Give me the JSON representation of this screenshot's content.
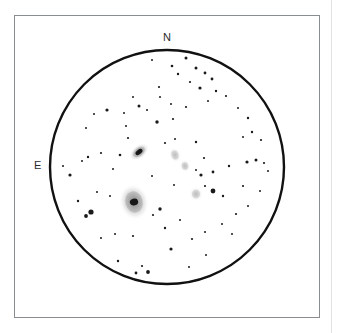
{
  "figure": {
    "kind": "telescope-eyepiece-sketch",
    "background_color": "#ffffff",
    "ink_color": "#1a1a1a",
    "frame": {
      "x": 14,
      "y": 15,
      "width": 306,
      "height": 303,
      "border_color": "#8a8d90"
    },
    "page_edge_rule": {
      "x": 331,
      "color": "#e2e3e5"
    }
  },
  "field_of_view": {
    "center_x": 167,
    "center_y": 167,
    "radius": 117,
    "outline_color": "#111111",
    "outline_width": 2.4
  },
  "orientation_labels": {
    "north": "N",
    "east": "E"
  },
  "chart_data": {
    "type": "scatter",
    "title": "",
    "xlabel": "",
    "ylabel": "",
    "grid": false,
    "legend": "none",
    "field_circle": {
      "cx": 167,
      "cy": 167,
      "r": 117
    },
    "xlim": [
      50,
      284
    ],
    "ylim": [
      50,
      284
    ],
    "galaxies": [
      {
        "name": "galaxy-elongated-upper",
        "cx": 139,
        "cy": 152,
        "rx": 11.5,
        "ry": 7.0,
        "angle": -38,
        "core_rx": 4.0,
        "core_ry": 2.3,
        "brightness": "bright"
      },
      {
        "name": "galaxy-large-lower",
        "cx": 134,
        "cy": 202,
        "rx": 15.0,
        "ry": 18.5,
        "angle": -15,
        "core_rx": 4.2,
        "core_ry": 3.4,
        "brightness": "bright"
      },
      {
        "name": "galaxy-faint-center-upper",
        "cx": 175,
        "cy": 155,
        "rx": 6.0,
        "ry": 8.0,
        "angle": -20,
        "core_rx": 0,
        "core_ry": 0,
        "brightness": "faint"
      },
      {
        "name": "galaxy-faint-center-lower",
        "cx": 185,
        "cy": 166,
        "rx": 5.5,
        "ry": 6.5,
        "angle": -10,
        "core_rx": 0,
        "core_ry": 0,
        "brightness": "faint"
      },
      {
        "name": "galaxy-faint-right",
        "cx": 196,
        "cy": 194,
        "rx": 7.0,
        "ry": 7.5,
        "angle": 0,
        "core_rx": 0,
        "core_ry": 0,
        "brightness": "faint"
      }
    ],
    "stars": [
      {
        "x": 186,
        "y": 58,
        "r": 1.5
      },
      {
        "x": 172,
        "y": 66,
        "r": 1.3
      },
      {
        "x": 196,
        "y": 68,
        "r": 1.5
      },
      {
        "x": 178,
        "y": 74,
        "r": 1.2
      },
      {
        "x": 205,
        "y": 73,
        "r": 1.4
      },
      {
        "x": 190,
        "y": 82,
        "r": 1.1
      },
      {
        "x": 212,
        "y": 79,
        "r": 1.4
      },
      {
        "x": 159,
        "y": 87,
        "r": 1.1
      },
      {
        "x": 200,
        "y": 88,
        "r": 1.6
      },
      {
        "x": 216,
        "y": 91,
        "r": 1.2
      },
      {
        "x": 139,
        "y": 106,
        "r": 1.5
      },
      {
        "x": 147,
        "y": 110,
        "r": 1.0
      },
      {
        "x": 124,
        "y": 113,
        "r": 1.0
      },
      {
        "x": 160,
        "y": 97,
        "r": 1.0
      },
      {
        "x": 133,
        "y": 97,
        "r": 1.0
      },
      {
        "x": 107,
        "y": 110,
        "r": 1.6
      },
      {
        "x": 94,
        "y": 114,
        "r": 1.0
      },
      {
        "x": 171,
        "y": 104,
        "r": 1.0
      },
      {
        "x": 157,
        "y": 122,
        "r": 1.7
      },
      {
        "x": 173,
        "y": 119,
        "r": 1.1
      },
      {
        "x": 186,
        "y": 107,
        "r": 1.1
      },
      {
        "x": 226,
        "y": 96,
        "r": 1.1
      },
      {
        "x": 238,
        "y": 108,
        "r": 1.0
      },
      {
        "x": 248,
        "y": 118,
        "r": 1.2
      },
      {
        "x": 252,
        "y": 132,
        "r": 1.2
      },
      {
        "x": 261,
        "y": 140,
        "r": 1.1
      },
      {
        "x": 86,
        "y": 128,
        "r": 1.0
      },
      {
        "x": 128,
        "y": 138,
        "r": 1.1
      },
      {
        "x": 120,
        "y": 155,
        "r": 1.3
      },
      {
        "x": 101,
        "y": 153,
        "r": 1.1
      },
      {
        "x": 88,
        "y": 157,
        "r": 1.2
      },
      {
        "x": 82,
        "y": 161,
        "r": 1.0
      },
      {
        "x": 70,
        "y": 175,
        "r": 1.6
      },
      {
        "x": 63,
        "y": 166,
        "r": 1.0
      },
      {
        "x": 175,
        "y": 139,
        "r": 1.0
      },
      {
        "x": 196,
        "y": 142,
        "r": 1.2
      },
      {
        "x": 165,
        "y": 143,
        "r": 1.1
      },
      {
        "x": 204,
        "y": 158,
        "r": 1.1
      },
      {
        "x": 196,
        "y": 170,
        "r": 1.0
      },
      {
        "x": 201,
        "y": 175,
        "r": 1.6
      },
      {
        "x": 213,
        "y": 172,
        "r": 1.4
      },
      {
        "x": 229,
        "y": 166,
        "r": 1.2
      },
      {
        "x": 247,
        "y": 162,
        "r": 1.6
      },
      {
        "x": 256,
        "y": 160,
        "r": 1.5
      },
      {
        "x": 264,
        "y": 163,
        "r": 1.1
      },
      {
        "x": 268,
        "y": 171,
        "r": 1.0
      },
      {
        "x": 243,
        "y": 186,
        "r": 1.1
      },
      {
        "x": 213,
        "y": 191,
        "r": 2.4
      },
      {
        "x": 205,
        "y": 186,
        "r": 1.1
      },
      {
        "x": 223,
        "y": 196,
        "r": 1.2
      },
      {
        "x": 91,
        "y": 212,
        "r": 2.6
      },
      {
        "x": 86,
        "y": 216,
        "r": 1.9
      },
      {
        "x": 78,
        "y": 201,
        "r": 1.2
      },
      {
        "x": 110,
        "y": 196,
        "r": 1.0
      },
      {
        "x": 115,
        "y": 234,
        "r": 1.0
      },
      {
        "x": 101,
        "y": 238,
        "r": 1.0
      },
      {
        "x": 133,
        "y": 236,
        "r": 1.1
      },
      {
        "x": 153,
        "y": 215,
        "r": 1.1
      },
      {
        "x": 160,
        "y": 209,
        "r": 1.7
      },
      {
        "x": 165,
        "y": 228,
        "r": 1.2
      },
      {
        "x": 180,
        "y": 220,
        "r": 1.0
      },
      {
        "x": 171,
        "y": 249,
        "r": 1.6
      },
      {
        "x": 192,
        "y": 239,
        "r": 1.1
      },
      {
        "x": 205,
        "y": 232,
        "r": 1.0
      },
      {
        "x": 222,
        "y": 224,
        "r": 1.0
      },
      {
        "x": 236,
        "y": 214,
        "r": 1.1
      },
      {
        "x": 232,
        "y": 234,
        "r": 1.0
      },
      {
        "x": 248,
        "y": 206,
        "r": 1.0
      },
      {
        "x": 118,
        "y": 261,
        "r": 1.2
      },
      {
        "x": 142,
        "y": 266,
        "r": 1.1
      },
      {
        "x": 148,
        "y": 272,
        "r": 1.9
      },
      {
        "x": 136,
        "y": 273,
        "r": 1.4
      },
      {
        "x": 189,
        "y": 267,
        "r": 1.0
      },
      {
        "x": 206,
        "y": 255,
        "r": 1.0
      },
      {
        "x": 174,
        "y": 185,
        "r": 1.0
      },
      {
        "x": 152,
        "y": 176,
        "r": 1.0
      },
      {
        "x": 113,
        "y": 169,
        "r": 1.0
      },
      {
        "x": 152,
        "y": 60,
        "r": 1.0
      },
      {
        "x": 208,
        "y": 101,
        "r": 1.0
      },
      {
        "x": 97,
        "y": 192,
        "r": 1.0
      },
      {
        "x": 260,
        "y": 191,
        "r": 1.0
      },
      {
        "x": 126,
        "y": 126,
        "r": 1.0
      },
      {
        "x": 243,
        "y": 137,
        "r": 1.0
      }
    ]
  }
}
